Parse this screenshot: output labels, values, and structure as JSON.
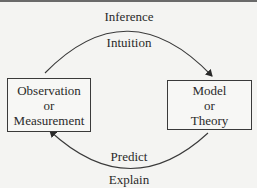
{
  "diagram": {
    "labels": {
      "top_outer": "Inference",
      "top_inner": "Intuition",
      "bottom_inner": "Predict",
      "bottom_outer": "Explain"
    },
    "nodes": [
      {
        "id": "observation",
        "lines": [
          "Observation",
          "or",
          "Measurement"
        ]
      },
      {
        "id": "model",
        "lines": [
          "Model",
          "or",
          "Theory"
        ]
      }
    ],
    "edges": [
      {
        "from": "observation",
        "to": "model",
        "labels": [
          "Inference",
          "Intuition"
        ]
      },
      {
        "from": "model",
        "to": "observation",
        "labels": [
          "Predict",
          "Explain"
        ]
      }
    ]
  }
}
